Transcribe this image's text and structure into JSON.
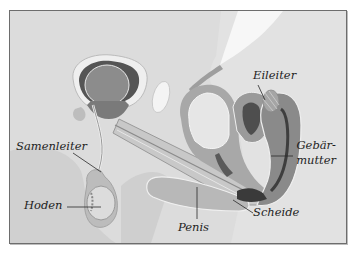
{
  "diagram": {
    "type": "anatomical cross-section",
    "colors": {
      "background": "#dcdcdc",
      "frame_border": "#6d6d6d",
      "organ_dark": "#5a5a5a",
      "organ_mid": "#8a8a8a",
      "organ_light": "#b5b5b5",
      "highlight": "#f2f2f2",
      "label_text": "#1e1e1e"
    },
    "labels": {
      "eileiter": "Eileiter",
      "samenleiter": "Samenleiter",
      "hoden": "Hoden",
      "gebaermutter_line1": "Gebär-",
      "gebaermutter_line2": "mutter",
      "scheide": "Scheide",
      "penis": "Penis"
    }
  }
}
